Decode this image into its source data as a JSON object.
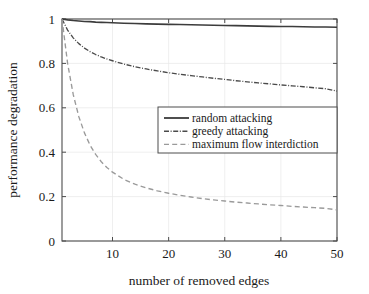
{
  "chart_data": {
    "type": "line",
    "title": "",
    "xlabel": "number of removed edges",
    "ylabel": "performance degradation",
    "xlim": [
      1,
      50
    ],
    "ylim": [
      0,
      1
    ],
    "xticks": [
      10,
      20,
      30,
      40,
      50
    ],
    "xtick_labels": [
      "10",
      "20",
      "30",
      "40",
      "50"
    ],
    "yticks": [
      0,
      0.2,
      0.4,
      0.6,
      0.8,
      1
    ],
    "ytick_labels": [
      "0",
      "0.2",
      "0.4",
      "0.6",
      "0.8",
      "1"
    ],
    "grid": true,
    "legend_position": "center-right",
    "x": [
      1,
      2,
      3,
      4,
      5,
      6,
      7,
      8,
      9,
      10,
      12,
      14,
      16,
      18,
      20,
      22,
      24,
      26,
      28,
      30,
      32,
      34,
      36,
      38,
      40,
      42,
      44,
      46,
      48,
      50
    ],
    "series": [
      {
        "name": "random attacking",
        "style": "solid",
        "color": "#3c3c3c",
        "values": [
          1.0,
          0.996,
          0.993,
          0.991,
          0.989,
          0.988,
          0.986,
          0.985,
          0.984,
          0.983,
          0.981,
          0.98,
          0.978,
          0.977,
          0.976,
          0.975,
          0.974,
          0.973,
          0.972,
          0.971,
          0.97,
          0.969,
          0.968,
          0.967,
          0.966,
          0.966,
          0.965,
          0.964,
          0.964,
          0.963
        ]
      },
      {
        "name": "greedy attacking",
        "style": "dashdot",
        "color": "#4a4a4a",
        "values": [
          1.0,
          0.95,
          0.915,
          0.889,
          0.869,
          0.853,
          0.84,
          0.829,
          0.82,
          0.812,
          0.797,
          0.785,
          0.775,
          0.766,
          0.758,
          0.751,
          0.745,
          0.739,
          0.733,
          0.728,
          0.722,
          0.717,
          0.712,
          0.708,
          0.703,
          0.699,
          0.695,
          0.69,
          0.686,
          0.675
        ]
      },
      {
        "name": "maximum flow interdiction",
        "style": "dashed",
        "color": "#9a9a9a",
        "values": [
          1.0,
          0.8,
          0.66,
          0.56,
          0.487,
          0.432,
          0.39,
          0.357,
          0.331,
          0.31,
          0.278,
          0.256,
          0.239,
          0.226,
          0.215,
          0.206,
          0.198,
          0.191,
          0.185,
          0.18,
          0.175,
          0.171,
          0.167,
          0.163,
          0.16,
          0.156,
          0.153,
          0.15,
          0.147,
          0.14
        ]
      }
    ],
    "legend_entries": [
      {
        "label": "random attacking",
        "style": "solid"
      },
      {
        "label": "greedy attacking",
        "style": "dashdot"
      },
      {
        "label": "maximum flow interdiction",
        "style": "dashed"
      }
    ],
    "colors": {
      "axis": "#4d4d4d",
      "grid": "#e8e8e8",
      "background": "#ffffff",
      "series_solid": "#3c3c3c",
      "series_dashdot": "#4a4a4a",
      "series_dashed": "#9a9a9a"
    }
  }
}
